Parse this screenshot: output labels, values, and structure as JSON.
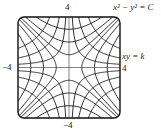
{
  "diagram": {
    "title_families": {
      "family1": "x² − y² = C",
      "family2": "xy = k"
    },
    "axis_labels": {
      "top": "4",
      "bottom": "−4",
      "left": "−4",
      "right": "4"
    },
    "range": {
      "xmin": -4,
      "xmax": 4,
      "ymin": -4,
      "ymax": 4
    },
    "hyperbola_C_values": [
      -9,
      -4,
      -1,
      1,
      4,
      9
    ],
    "hyperbola_k_values": [
      -6,
      -3,
      -1,
      1,
      3,
      6
    ],
    "stroke_color": "#1a1a1a"
  }
}
